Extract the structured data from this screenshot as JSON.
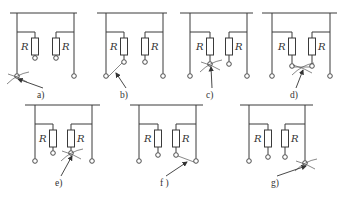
{
  "figure": {
    "resistor_label": "R",
    "panels": [
      {
        "id": "a",
        "label": "a)",
        "bar": [
          10,
          77
        ],
        "barY": 13,
        "xs": [
          17,
          35,
          56,
          74
        ],
        "termY": [
          76,
          58,
          58,
          76
        ],
        "marked": 0,
        "arcs": true
      },
      {
        "id": "b",
        "label": "b)",
        "bar": [
          97,
          167
        ],
        "barY": 13,
        "xs": [
          106,
          124,
          145,
          163
        ],
        "termY": [
          76,
          62,
          62,
          76
        ],
        "marked": "0-1",
        "arcs": false
      },
      {
        "id": "c",
        "label": "c)",
        "bar": [
          180,
          253
        ],
        "barY": 13,
        "xs": [
          190,
          210,
          229,
          247
        ],
        "termY": [
          76,
          64,
          64,
          76
        ],
        "marked": 1,
        "arcs": true
      },
      {
        "id": "d",
        "label": "d)",
        "bar": [
          262,
          337
        ],
        "barY": 13,
        "xs": [
          272,
          292,
          312,
          330
        ],
        "termY": [
          76,
          66,
          66,
          76
        ],
        "marked": "1-2",
        "arcs": true
      },
      {
        "id": "e",
        "label": "e)",
        "bar": [
          25,
          100
        ],
        "barY": 105,
        "xs": [
          35,
          53,
          71,
          92
        ],
        "termY": [
          161,
          153,
          153,
          161
        ],
        "marked": 2,
        "arcs": true
      },
      {
        "id": "f",
        "label": "f )",
        "bar": [
          130,
          203
        ],
        "barY": 105,
        "xs": [
          139,
          158,
          176,
          196
        ],
        "termY": [
          161,
          155,
          155,
          161
        ],
        "marked": "2-3",
        "arcs": false
      },
      {
        "id": "g",
        "label": "g)",
        "bar": [
          240,
          313
        ],
        "barY": 105,
        "xs": [
          249,
          268,
          285,
          305
        ],
        "termY": [
          161,
          157,
          157,
          163
        ],
        "marked": 3,
        "arcs": true
      }
    ],
    "label_positions": {
      "a": [
        39,
        98
      ],
      "b": [
        122,
        98
      ],
      "c": [
        208,
        98
      ],
      "d": [
        292,
        98
      ],
      "e": [
        57,
        186
      ],
      "f": [
        162,
        186
      ],
      "g": [
        273,
        186
      ]
    }
  }
}
